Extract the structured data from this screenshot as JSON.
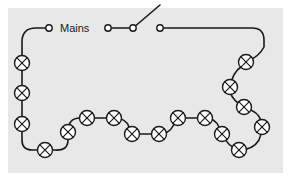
{
  "diagram": {
    "type": "electrical-circuit-schematic",
    "labels": {
      "mains": "Mains"
    },
    "colors": {
      "background": "#ffffff",
      "panel": "#e8e8e8",
      "wire": "#1a1a1a",
      "lamp_fill": "#ffffff",
      "terminal_fill": "#ffffff",
      "text": "#1a1a1a"
    },
    "panel": {
      "x": 8,
      "y": 8,
      "width": 275,
      "height": 165
    },
    "switch": {
      "name": "open-switch",
      "state": "open",
      "left_terminal": {
        "x": 108,
        "y": 28
      },
      "pivot_terminal": {
        "x": 133,
        "y": 28
      },
      "right_terminal": {
        "x": 160,
        "y": 28
      },
      "lever_tip": {
        "x": 160,
        "y": 5
      }
    },
    "mains_terminal": {
      "x": 49,
      "y": 28
    },
    "lamp_radius": 7.5,
    "lamp_count": 20,
    "lamps": [
      {
        "id": "lamp-1",
        "x": 22,
        "y": 63
      },
      {
        "id": "lamp-2",
        "x": 22,
        "y": 93
      },
      {
        "id": "lamp-3",
        "x": 22,
        "y": 124
      },
      {
        "id": "lamp-4",
        "x": 45,
        "y": 150
      },
      {
        "id": "lamp-5",
        "x": 68,
        "y": 132
      },
      {
        "id": "lamp-6",
        "x": 87,
        "y": 118
      },
      {
        "id": "lamp-7",
        "x": 114,
        "y": 118
      },
      {
        "id": "lamp-8",
        "x": 132,
        "y": 134
      },
      {
        "id": "lamp-9",
        "x": 159,
        "y": 134
      },
      {
        "id": "lamp-10",
        "x": 178,
        "y": 118
      },
      {
        "id": "lamp-11",
        "x": 205,
        "y": 118
      },
      {
        "id": "lamp-12",
        "x": 222,
        "y": 134
      },
      {
        "id": "lamp-13",
        "x": 239,
        "y": 150
      },
      {
        "id": "lamp-14",
        "x": 262,
        "y": 127
      },
      {
        "id": "lamp-15",
        "x": 244,
        "y": 107
      },
      {
        "id": "lamp-16",
        "x": 230,
        "y": 87
      },
      {
        "id": "lamp-17",
        "x": 246,
        "y": 62
      }
    ],
    "wire_paths": {
      "left_branch": "M 49 28 L 36 28 Q 22 28 22 42 L 22 63 L 22 93 L 22 124 L 22 140 Q 22 150 32 150 L 45 150",
      "bottom_chain": "M 45 150 L 55 150 Q 68 150 68 140 L 68 132 Q 68 118 80 118 L 87 118 L 114 118 Q 125 118 128 126 Q 132 134 132 134 L 159 134 Q 168 134 172 126 Q 178 118 178 118 L 205 118 Q 214 118 218 126 Q 222 134 222 134 Q 228 146 239 150 L 239 150",
      "right_branch": "M 239 150 Q 252 150 258 140 Q 262 132 262 127 Q 262 116 252 110 Q 244 107 244 107 Q 233 100 230 92 Q 229 87 230 87 Q 232 74 242 66 Q 246 62 246 62 Q 258 58 264 48 L 264 40 Q 264 28 252 28 L 160 28"
    }
  }
}
